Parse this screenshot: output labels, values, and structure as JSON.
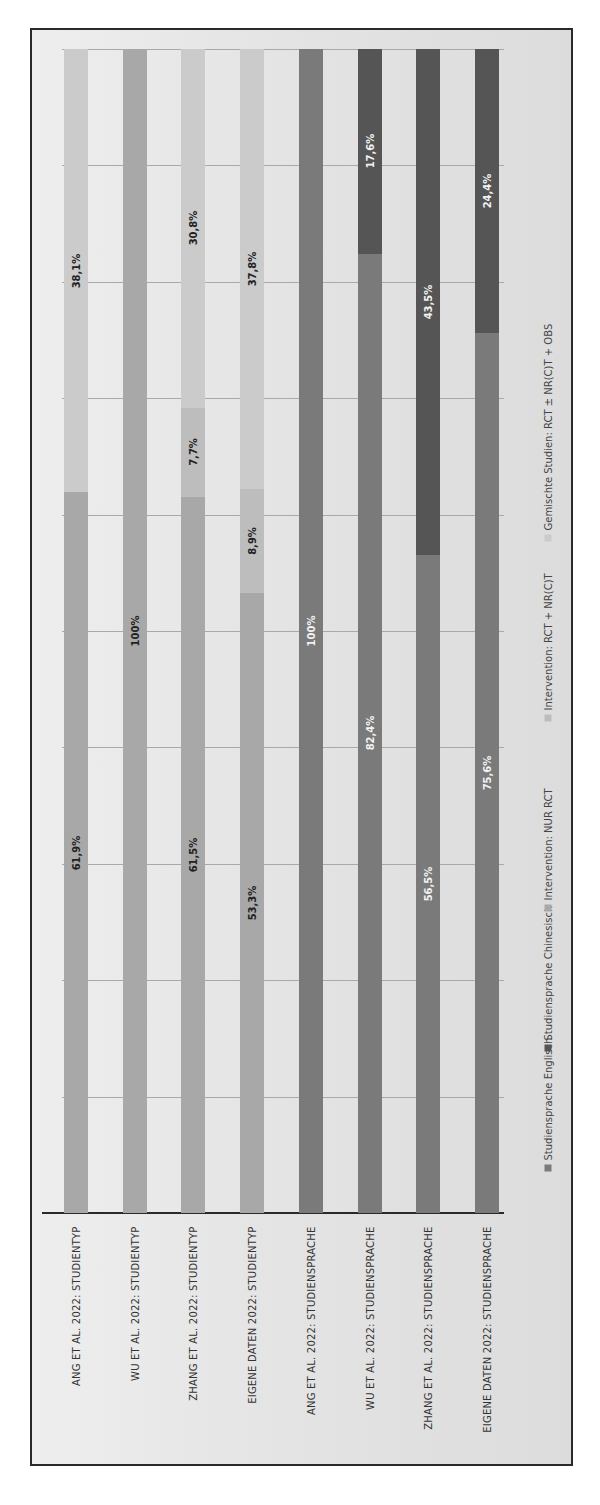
{
  "chart_data": {
    "type": "bar",
    "orientation": "vertical stacked 100% (image rotated 90° counter-clockwise)",
    "title": "",
    "xlabel": "",
    "ylabel": "",
    "ylim": [
      0,
      100
    ],
    "grid": true,
    "legend_position": "bottom (rotated, right side of image)",
    "categories": [
      "ANG ET AL. 2022: STUDIENTYP",
      "WU ET AL. 2022: STUDIENTYP",
      "ZHANG ET AL. 2022: STUDIENTYP",
      "EIGENE DATEN 2022: STUDIENTYP",
      "ANG ET AL. 2022: STUDIENSPRACHE",
      "WU ET AL. 2022: STUDIENSPRACHE",
      "ZHANG ET AL. 2022: STUDIENSPRACHE",
      "EIGENE DATEN 2022: STUDIENSPRACHE"
    ],
    "series": [
      {
        "name": "Studiensprache Englisch",
        "color": "#7a7a7a",
        "values": [
          0,
          0,
          0,
          0,
          100,
          82.4,
          56.5,
          75.6
        ],
        "labels": [
          "",
          "",
          "",
          "",
          "100%",
          "82,4%",
          "56,5%",
          "75,6%"
        ]
      },
      {
        "name": "Studiensprache Chinesisch",
        "color": "#555555",
        "values": [
          0,
          0,
          0,
          0,
          0,
          17.6,
          43.5,
          24.4
        ],
        "labels": [
          "",
          "",
          "",
          "",
          "",
          "17,6%",
          "43,5%",
          "24,4%"
        ]
      },
      {
        "name": "Intervention: NUR RCT",
        "color": "#a8a8a8",
        "values": [
          61.9,
          100,
          61.5,
          53.3,
          0,
          0,
          0,
          0
        ],
        "labels": [
          "61,9%",
          "100%",
          "61,5%",
          "53,3%",
          "",
          "",
          "",
          ""
        ]
      },
      {
        "name": "Intervention: RCT + NR(C)T",
        "color": "#bdbdbd",
        "values": [
          0,
          0,
          7.7,
          8.9,
          0,
          0,
          0,
          0
        ],
        "labels": [
          "",
          "",
          "7,7%",
          "8,9%",
          "",
          "",
          "",
          ""
        ]
      },
      {
        "name": "Gemischte Studien: RCT ± NR(C)T + OBS",
        "color": "#cbcbcb",
        "values": [
          38.1,
          0,
          30.8,
          37.8,
          0,
          0,
          0,
          0
        ],
        "labels": [
          "38,1%",
          "",
          "30,8%",
          "37,8%",
          "",
          "",
          "",
          ""
        ]
      }
    ]
  },
  "legend": [
    {
      "label": "Studiensprache Englisch",
      "color": "#7a7a7a"
    },
    {
      "label": "Studiensprache Chinesisch",
      "color": "#555555"
    },
    {
      "label": "Intervention: NUR RCT",
      "color": "#a8a8a8"
    },
    {
      "label": "Intervention: RCT + NR(C)T",
      "color": "#bdbdbd"
    },
    {
      "label": "Gemischte Studien: RCT ± NR(C)T + OBS",
      "color": "#cbcbcb"
    }
  ]
}
